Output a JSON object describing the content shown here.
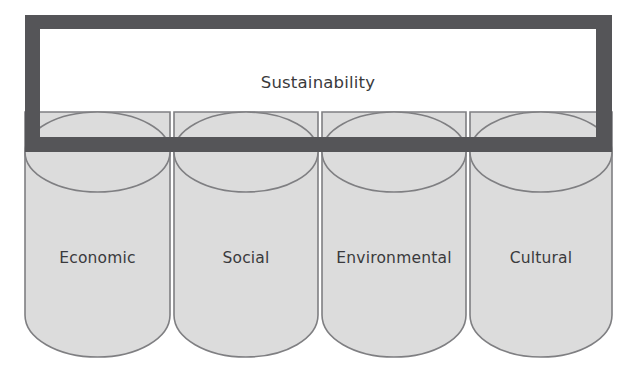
{
  "diagram": {
    "type": "pillars-supporting-banner",
    "banner": {
      "label": "Sustainability",
      "frame_color": "#555558",
      "fill_color": "#ffffff"
    },
    "pillars": [
      {
        "label": "Economic"
      },
      {
        "label": "Social"
      },
      {
        "label": "Environmental"
      },
      {
        "label": "Cultural"
      }
    ],
    "colors": {
      "cylinder_fill": "#dcdcdc",
      "cylinder_stroke": "#7f7f82",
      "frame_dark": "#555558",
      "text": "#3a3a3c",
      "background": "#ffffff"
    }
  }
}
